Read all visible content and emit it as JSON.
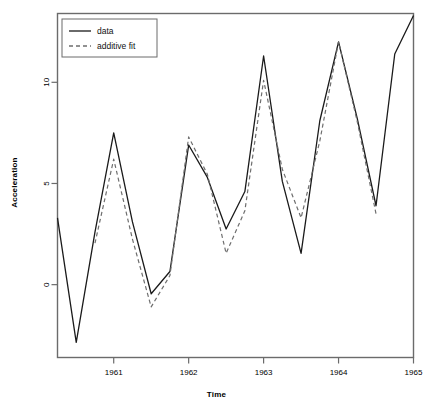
{
  "chart_data": {
    "type": "line",
    "title": "",
    "xlabel": "Time",
    "ylabel": "Acceleration",
    "xlim": [
      1960.25,
      1965.0
    ],
    "ylim": [
      -3.6,
      13.4
    ],
    "xticks": [
      1961,
      1962,
      1963,
      1964,
      1965
    ],
    "xticklabels": [
      "1961",
      "1962",
      "1963",
      "1964",
      "1965"
    ],
    "yticks": [
      0,
      5,
      10
    ],
    "yticklabels": [
      "0",
      "5",
      "10"
    ],
    "grid": false,
    "legend_position": "top-left",
    "x": [
      1960.25,
      1960.5,
      1960.75,
      1961.0,
      1961.25,
      1961.5,
      1961.75,
      1962.0,
      1962.25,
      1962.5,
      1962.75,
      1963.0,
      1963.25,
      1963.5,
      1963.75,
      1964.0,
      1964.25,
      1964.5,
      1964.75,
      1965.0
    ],
    "series": [
      {
        "name": "data",
        "style": "solid",
        "color": "#1a1a1a",
        "values": [
          3.3,
          -2.85,
          2.6,
          7.5,
          3.1,
          -0.45,
          0.65,
          6.9,
          5.3,
          2.75,
          4.6,
          11.3,
          5.1,
          1.55,
          8.1,
          12.0,
          8.2,
          3.9,
          11.4,
          13.3
        ]
      },
      {
        "name": "additive fit",
        "style": "dashed",
        "color": "#6e6e6e",
        "values": [
          null,
          null,
          2.05,
          6.2,
          2.25,
          -1.1,
          0.45,
          7.3,
          5.45,
          1.55,
          3.65,
          10.1,
          5.7,
          3.3,
          7.1,
          12.0,
          8.05,
          3.5,
          null,
          null
        ]
      }
    ],
    "legend": [
      {
        "label": "data",
        "style": "solid",
        "color": "#1a1a1a"
      },
      {
        "label": "additive fit",
        "style": "dashed",
        "color": "#6e6e6e"
      }
    ]
  },
  "axes": {
    "x_title": "Time",
    "y_title": "Acceleration"
  }
}
